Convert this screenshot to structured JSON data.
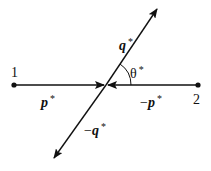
{
  "diagram": {
    "colors": {
      "stroke": "#111111",
      "background": "#ffffff"
    },
    "center": {
      "x": 106,
      "y": 85
    },
    "particles": [
      {
        "id": "1",
        "label": "1",
        "x": 14,
        "y": 85
      },
      {
        "id": "2",
        "label": "2",
        "x": 198,
        "y": 85
      }
    ],
    "vectors": [
      {
        "name": "p-star",
        "symbol": "p",
        "prefix": "",
        "sup": "*",
        "from": [
          14,
          85
        ],
        "to": [
          104,
          85
        ]
      },
      {
        "name": "minus-p-star",
        "symbol": "p",
        "prefix": "−",
        "sup": "*",
        "from": [
          198,
          85
        ],
        "to": [
          108,
          85
        ]
      },
      {
        "name": "q-star",
        "symbol": "q",
        "prefix": "",
        "sup": "*",
        "from": [
          106,
          85
        ],
        "to": [
          157,
          9
        ]
      },
      {
        "name": "minus-q-star",
        "symbol": "q",
        "prefix": "−",
        "sup": "*",
        "from": [
          106,
          85
        ],
        "to": [
          54,
          158
        ]
      }
    ],
    "angle": {
      "symbol": "θ",
      "sup": "*",
      "radius": 25
    },
    "labels": {
      "particle_1": "1",
      "particle_2": "2",
      "p_star": {
        "prefix": "",
        "symbol": "p",
        "sup": "*"
      },
      "minus_p_star": {
        "prefix": "−",
        "symbol": "p",
        "sup": "*"
      },
      "q_star": {
        "prefix": "",
        "symbol": "q",
        "sup": "*"
      },
      "minus_q_star": {
        "prefix": "−",
        "symbol": "q",
        "sup": "*"
      },
      "theta_star": {
        "symbol": "θ",
        "sup": "*"
      }
    }
  }
}
